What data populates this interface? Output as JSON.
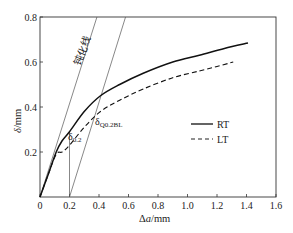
{
  "chart_data": {
    "type": "line",
    "title": "",
    "xlabel": "Δa/mm",
    "ylabel": "δ/mm",
    "xlim": [
      0,
      1.6
    ],
    "ylim": [
      0,
      0.8
    ],
    "xticks": [
      0,
      0.2,
      0.4,
      0.6,
      0.8,
      1.0,
      1.2,
      1.4,
      1.6
    ],
    "xtick_labels": [
      "0",
      "0.2",
      "0.4",
      "0.6",
      "0.8",
      "1.0",
      "1.2",
      "1.4",
      "1.6"
    ],
    "yticks": [
      0.2,
      0.4,
      0.6,
      0.8
    ],
    "ytick_labels": [
      "0.2",
      "0.4",
      "0.6",
      "0.8"
    ],
    "grid": false,
    "legend_position": "lower right inside",
    "series": [
      {
        "name": "RT",
        "style": "solid",
        "x": [
          0,
          0.05,
          0.11,
          0.15,
          0.2,
          0.3,
          0.41,
          0.54,
          0.7,
          0.9,
          1.08,
          1.25,
          1.41
        ],
        "y": [
          0,
          0.09,
          0.2,
          0.25,
          0.29,
          0.38,
          0.45,
          0.5,
          0.55,
          0.6,
          0.63,
          0.66,
          0.684
        ]
      },
      {
        "name": "LT",
        "style": "dashed",
        "x": [
          0,
          0.05,
          0.11,
          0.15,
          0.2,
          0.3,
          0.41,
          0.54,
          0.7,
          0.9,
          1.08,
          1.2,
          1.31
        ],
        "y": [
          0,
          0.09,
          0.19,
          0.2,
          0.23,
          0.31,
          0.38,
          0.43,
          0.48,
          0.53,
          0.56,
          0.58,
          0.6
        ]
      }
    ],
    "reference_lines": [
      {
        "name": "blunting line",
        "x": [
          0,
          0.386
        ],
        "y": [
          0,
          0.8
        ]
      },
      {
        "name": "0.2 mm offset line",
        "x": [
          0.2,
          0.58
        ],
        "y": [
          0,
          0.8
        ]
      },
      {
        "name": "vertical at 0.2",
        "x": [
          0.2,
          0.2
        ],
        "y": [
          0,
          0.29
        ]
      }
    ],
    "annotations": [
      {
        "text": "钝化线",
        "target": "blunting line"
      },
      {
        "text": "δ",
        "sub": "0.2",
        "at": [
          0.2,
          0.29
        ]
      },
      {
        "text": "δ",
        "sub": "Q0.2BL",
        "at": [
          0.38,
          0.36
        ]
      }
    ]
  },
  "labels": {
    "xlabel_main": "Δ",
    "xlabel_italic": "a",
    "xlabel_unit": "/mm",
    "ylabel_italic": "δ",
    "ylabel_unit": "/mm",
    "blunting": "钝化线",
    "d02_main": "δ",
    "d02_sub": "0.2",
    "dq_main": "δ",
    "dq_sub": "Q0.2BL",
    "legend_rt": "RT",
    "legend_lt": "LT"
  }
}
